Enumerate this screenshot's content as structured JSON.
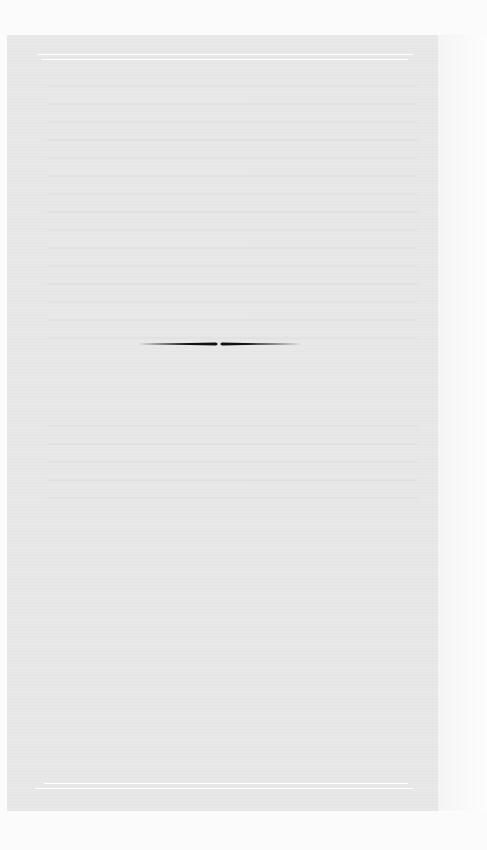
{
  "page": {
    "type": "blank-book-page",
    "content_text": "",
    "frame": {
      "top_rule": "double",
      "bottom_rule": "double"
    },
    "ornament": {
      "kind": "tapered-horizontal-rule",
      "color": "#111111"
    },
    "colors": {
      "background": "#fbfbfb",
      "page_tone": "#e8e8e8",
      "rule": "#ffffff",
      "ornament": "#111111"
    }
  }
}
